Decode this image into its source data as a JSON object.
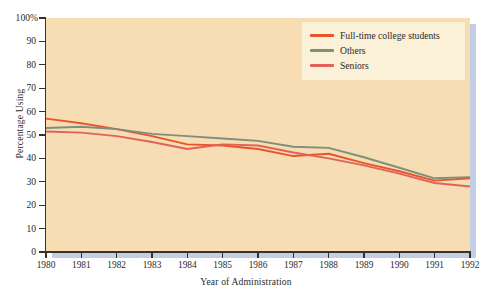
{
  "chart_data": {
    "type": "line",
    "title": "",
    "xlabel": "Year of Administration",
    "ylabel": "Percentage Using",
    "x": [
      1980,
      1981,
      1982,
      1983,
      1984,
      1985,
      1986,
      1987,
      1988,
      1989,
      1990,
      1991,
      1992
    ],
    "categories": [
      "1980",
      "1981",
      "1982",
      "1983",
      "1984",
      "1985",
      "1986",
      "1987",
      "1988",
      "1989",
      "1990",
      "1991",
      "1992"
    ],
    "xlim": [
      1980,
      1992
    ],
    "ylim": [
      0,
      100
    ],
    "yticks": [
      0,
      10,
      20,
      30,
      40,
      50,
      60,
      70,
      80,
      90,
      100
    ],
    "ytick_labels": [
      "0",
      "10",
      "20",
      "30",
      "40",
      "50",
      "60",
      "70",
      "80",
      "90",
      "100%"
    ],
    "grid": false,
    "legend_position": "top-right",
    "series": [
      {
        "name": "Full-time college students",
        "color": "#e8552b",
        "values": [
          57,
          55,
          52.5,
          49.5,
          46,
          45.5,
          44,
          41,
          42,
          38,
          34.5,
          30.5,
          31.5
        ]
      },
      {
        "name": "Others",
        "color": "#7e8f7c",
        "values": [
          53,
          53.5,
          52.5,
          50.5,
          49.5,
          48.5,
          47.5,
          45,
          44.5,
          40.5,
          36,
          31.5,
          32
        ]
      },
      {
        "name": "Seniors",
        "color": "#e2615a",
        "values": [
          51.5,
          51,
          49.5,
          47,
          44,
          46,
          45.5,
          42.5,
          40,
          37,
          33.5,
          29.5,
          28
        ]
      }
    ]
  },
  "axes": {
    "x_title": "Year of Administration",
    "y_title": "Percentage Using"
  },
  "legend": {
    "items": [
      {
        "label": "Full-time college students",
        "color": "#e8552b"
      },
      {
        "label": "Others",
        "color": "#7e8f7c"
      },
      {
        "label": "Seniors",
        "color": "#e2615a"
      }
    ]
  },
  "colors": {
    "plot_background": "#f6ddb4",
    "legend_background": "#fbf0d8",
    "page_background": "#ffffff",
    "axis": "#3a3226",
    "shadow": "#c3cde3"
  }
}
